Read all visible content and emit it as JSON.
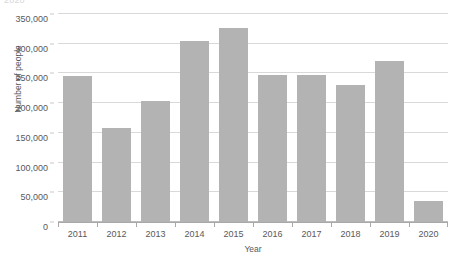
{
  "clipped_top_text": "2020",
  "chart_data": {
    "type": "bar",
    "title": "",
    "xlabel": "Year",
    "ylabel": "Number of people",
    "categories": [
      "2011",
      "2012",
      "2013",
      "2014",
      "2015",
      "2016",
      "2017",
      "2018",
      "2019",
      "2020"
    ],
    "values": [
      245000,
      158000,
      204000,
      304000,
      326000,
      248000,
      248000,
      230000,
      271000,
      35000
    ],
    "ylim": [
      0,
      350000
    ],
    "ytick_step": 50000,
    "ytick_labels": [
      "0",
      "50,000",
      "100,000",
      "150,000",
      "200,000",
      "250,000",
      "300,000",
      "350,000"
    ],
    "ytick_values": [
      0,
      50000,
      100000,
      150000,
      200000,
      250000,
      300000,
      350000
    ],
    "grid": true,
    "legend": "none",
    "bar_color": "#b3b3b3",
    "gridline_color": "#d9d9d9",
    "axis_color": "#a8a8a8",
    "text_color": "#58595b",
    "background": "#ffffff"
  }
}
